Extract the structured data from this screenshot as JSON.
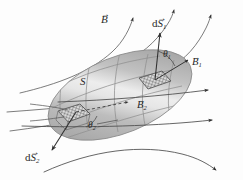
{
  "figure": {
    "domain": "Diagram",
    "background_color": "#fdfdfd",
    "ink_color": "#2a2a2a",
    "surface_color": "#b0b0b0",
    "surface_highlight_color": "#e4e4e4",
    "hatch_color": "#555555"
  },
  "labels": {
    "field_B": {
      "text": "B",
      "vector": true,
      "x": 101,
      "y": 14
    },
    "dS1": {
      "text_d": "d",
      "text_S": "S",
      "sub": "1",
      "vector": true,
      "x": 152,
      "y": 18
    },
    "theta1": {
      "text": "θ",
      "sub": "1",
      "x": 163,
      "y": 50
    },
    "B1": {
      "text": "B",
      "sub": "1",
      "vector": true,
      "x": 192,
      "y": 57
    },
    "surface_S": {
      "text": "S",
      "x": 80,
      "y": 76
    },
    "B2": {
      "text": "B",
      "sub": "2",
      "vector": true,
      "x": 137,
      "y": 100
    },
    "theta2": {
      "text": "θ",
      "sub": "2",
      "x": 88,
      "y": 121
    },
    "dS2": {
      "text_d": "d",
      "text_S": "S",
      "sub": "2",
      "vector": true,
      "x": 25,
      "y": 152
    }
  },
  "elements": {
    "surface": {
      "name": "open-surface-S"
    },
    "patch1": {
      "name": "area-element-patch-1"
    },
    "patch2": {
      "name": "area-element-patch-2"
    },
    "field_lines_count": 7,
    "normal_vectors_count": 2
  }
}
